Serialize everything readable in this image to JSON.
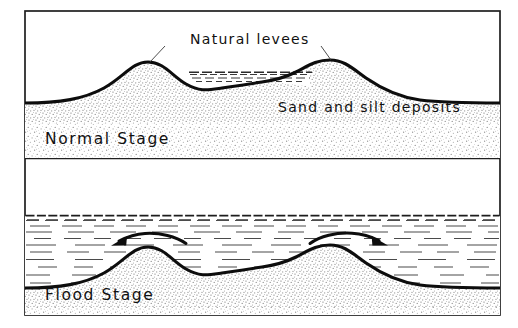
{
  "figure": {
    "frame_color": "#1a1a1a",
    "ink_color": "#111111",
    "water_color": "#444444",
    "stipple_color": "#8a8a8a",
    "background": "#ffffff"
  },
  "panels": [
    {
      "id": "normal-stage",
      "stage_label": "Normal Stage",
      "annotations": [
        {
          "id": "natural-levees",
          "text": "Natural  levees"
        },
        {
          "id": "sand-and-silt-deposits",
          "text": "Sand and  silt  deposits"
        }
      ]
    },
    {
      "id": "flood-stage",
      "stage_label": "Flood  Stage",
      "annotations": [],
      "flow_arrows": [
        {
          "id": "flow-arrow-left",
          "direction": "left"
        },
        {
          "id": "flow-arrow-right",
          "direction": "right"
        }
      ]
    }
  ],
  "labels": {
    "natural_levees": "Natural  levees",
    "sand_and_silt": "Sand and  silt  deposits",
    "normal_stage": "Normal  Stage",
    "flood_stage": "Flood  Stage"
  }
}
